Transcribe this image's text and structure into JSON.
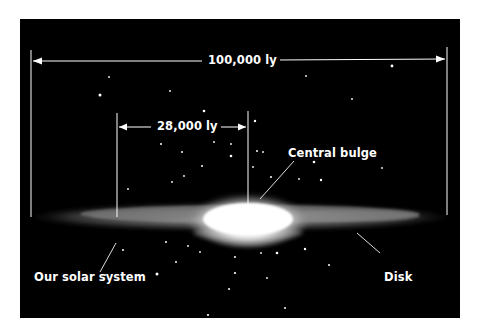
{
  "diagram": {
    "labels": {
      "diameter": "100,000 ly",
      "sun_distance": "28,000 ly",
      "bulge": "Central bulge",
      "sun": "Our solar system",
      "disk": "Disk"
    },
    "measurements": [
      {
        "name": "Galaxy diameter",
        "value": "100,000 ly"
      },
      {
        "name": "Distance from center to solar system",
        "value": "28,000 ly"
      }
    ],
    "colors": {
      "background": "#000000",
      "page": "#ffffff",
      "lines": "#ffffff",
      "text": "#ffffff"
    }
  }
}
